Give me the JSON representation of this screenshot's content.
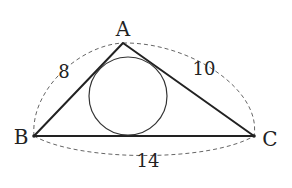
{
  "diagram": {
    "type": "triangle-with-incircle",
    "vertices": {
      "A": {
        "label": "A",
        "x": 123,
        "y": 43
      },
      "B": {
        "label": "B",
        "x": 34,
        "y": 136
      },
      "C": {
        "label": "C",
        "x": 254,
        "y": 136
      }
    },
    "sides": {
      "AB": {
        "label": "8"
      },
      "AC": {
        "label": "10"
      },
      "BC": {
        "label": "14"
      }
    },
    "incircle": {
      "cx": 128,
      "cy": 96,
      "r": 39
    },
    "colors": {
      "stroke": "#222222",
      "dashed": "#666666",
      "background": "#ffffff"
    }
  }
}
